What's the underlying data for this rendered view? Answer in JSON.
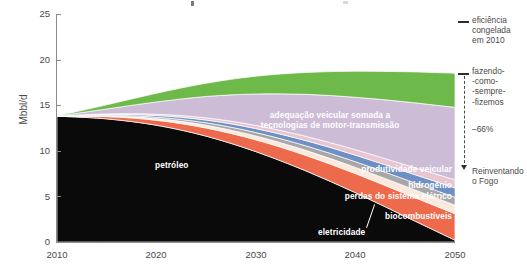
{
  "chart_data": {
    "type": "area",
    "stacked": true,
    "title": "",
    "xlabel": "",
    "ylabel": "Mbbl/d",
    "xlim": [
      2010,
      2050
    ],
    "ylim": [
      0,
      25
    ],
    "yticks": [
      0,
      5,
      10,
      15,
      20,
      25
    ],
    "xticks": [
      2010,
      2020,
      2030,
      2040,
      2050
    ],
    "grid": false,
    "legend_position": "inline-band-labels",
    "x": [
      2010,
      2015,
      2020,
      2025,
      2030,
      2035,
      2040,
      2045,
      2050
    ],
    "series": [
      {
        "name": "petróleo",
        "color": "#0a0a0a",
        "values": [
          13.8,
          13.5,
          12.8,
          11.6,
          9.9,
          7.8,
          5.4,
          2.8,
          0.2
        ]
      },
      {
        "name": "biocombustíveis",
        "color": "#ee6a4d",
        "values": [
          0.0,
          0.25,
          0.55,
          0.9,
          1.3,
          1.7,
          2.1,
          2.5,
          2.9
        ]
      },
      {
        "name": "eletricidade",
        "color": "#fbe9dd",
        "values": [
          0.0,
          0.08,
          0.18,
          0.3,
          0.42,
          0.55,
          0.68,
          0.82,
          0.95
        ]
      },
      {
        "name": "perdas do sistema elétrico",
        "color": "#a7a7a7",
        "values": [
          0.0,
          0.07,
          0.16,
          0.27,
          0.38,
          0.5,
          0.62,
          0.74,
          0.86
        ]
      },
      {
        "name": "hidrogênio",
        "color": "#6d8fc4",
        "values": [
          0.0,
          0.08,
          0.18,
          0.3,
          0.43,
          0.57,
          0.72,
          0.87,
          1.02
        ]
      },
      {
        "name": "produtividade veicular",
        "color": "#e8c5d0",
        "values": [
          0.0,
          0.06,
          0.14,
          0.24,
          0.35,
          0.47,
          0.6,
          0.74,
          0.88
        ]
      },
      {
        "name": "adequação veicular somada a tecnologias de motor-transmissão",
        "color": "#cdbcd6",
        "values": [
          0.0,
          0.55,
          1.35,
          2.35,
          3.45,
          4.6,
          5.75,
          6.9,
          7.95
        ]
      },
      {
        "name": "eficiência da EIA",
        "color": "#6dba4a",
        "values": [
          0.0,
          0.45,
          0.95,
          1.45,
          1.95,
          2.4,
          2.85,
          3.3,
          3.75
        ]
      }
    ],
    "annotations": [
      {
        "name": "eficiencia-congelada",
        "text": "eficiência\ncongelada\nem 2010",
        "at_year": 2050,
        "at_value": 19.6
      },
      {
        "name": "fazendo-como-sempre-fizemos",
        "text": "fazendo-\n-como-\n-sempre-\n-fizemos",
        "at_year": 2050,
        "at_value": 16.6
      },
      {
        "name": "reducao-percentual",
        "text": "–66%",
        "at_year": 2050,
        "at_value": 9.0
      },
      {
        "name": "reinventando-o-fogo",
        "text": "Reinventando\no Fogo",
        "at_year": 2050,
        "at_value": 5.7
      }
    ]
  },
  "axes": {
    "ylabel": "Mbbl/d",
    "yticks": [
      "25",
      "20",
      "15",
      "10",
      "5",
      "0"
    ],
    "xticks": [
      "2010",
      "2020",
      "2030",
      "2040",
      "2050"
    ]
  },
  "band_labels": {
    "eficiencia_eia": "eficiência da EIA",
    "adequacao_line1": "adequação veicular somada a",
    "adequacao_line2": "tecnologias de motor-transmissão",
    "produtividade": "produtividade veicular",
    "hidrogenio": "hidrogênio",
    "perdas": "perdas do sistema elétrico",
    "biocombustiveis": "biocombustíveis",
    "eletricidade": "eletricidade",
    "petroleo": "petróleo"
  },
  "right_annotations": {
    "frozen_efficiency": "eficiência\ncongelada\nem 2010",
    "business_as_usual": "fazendo-\n-como-\n-sempre-\n-fizemos",
    "reduction": "–66%",
    "reinventing_fire": "Reinventando\no Fogo"
  },
  "colors": {
    "petroleo": "#0a0a0a",
    "biocombustiveis": "#ee6a4d",
    "eletricidade": "#fbe9dd",
    "perdas": "#a7a7a7",
    "hidrogenio": "#6d8fc4",
    "produtividade": "#e8c5d0",
    "adequacao": "#cdbcd6",
    "eficiencia_eia": "#6dba4a",
    "axis": "#8b8b8b",
    "text": "#4a4a4a"
  }
}
